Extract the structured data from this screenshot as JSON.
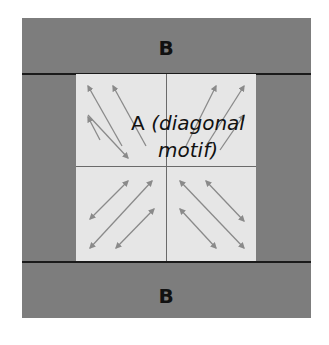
{
  "diagram": {
    "top_region_label": "B",
    "bottom_region_label": "B",
    "center_label_letter": "A",
    "center_label_line1": "(diagonal",
    "center_label_line2": "motif)",
    "colors": {
      "outer_fill": "#7d7d7d",
      "inner_fill": "#e6e6e6",
      "arrow": "#8a8a8a",
      "divider": "#1a1a1a"
    },
    "quadrants": [
      {
        "name": "top-left",
        "arrow_direction": "up-left",
        "arrow_count": 4
      },
      {
        "name": "top-right",
        "arrow_direction": "up-right",
        "arrow_count": 3
      },
      {
        "name": "bottom-left",
        "arrow_direction": "double-headed diagonal (down-left / up-right)",
        "arrow_count": 3
      },
      {
        "name": "bottom-right",
        "arrow_direction": "double-headed diagonal (up-left / down-right)",
        "arrow_count": 3
      }
    ]
  }
}
